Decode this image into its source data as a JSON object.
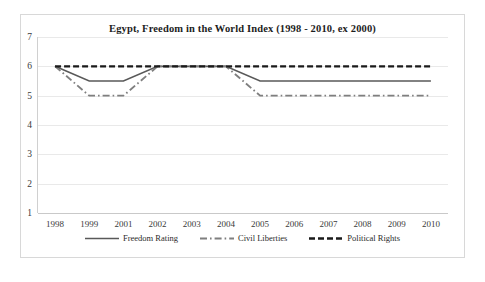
{
  "chart_data": {
    "type": "line",
    "title": "Egypt, Freedom in the World Index (1998 - 2010, ex 2000)",
    "xlabel": "",
    "ylabel": "",
    "categories": [
      "1998",
      "1999",
      "2001",
      "2002",
      "2003",
      "2004",
      "2005",
      "2006",
      "2007",
      "2008",
      "2009",
      "2010"
    ],
    "ylim": [
      1,
      7
    ],
    "yticks": [
      "1",
      "2",
      "3",
      "4",
      "5",
      "6",
      "7"
    ],
    "grid": true,
    "legend_position": "bottom",
    "series": [
      {
        "name": "Freedom Rating",
        "style": "solid",
        "color": "#595959",
        "values": [
          6,
          5.5,
          5.5,
          6,
          6,
          6,
          5.5,
          5.5,
          5.5,
          5.5,
          5.5,
          5.5
        ]
      },
      {
        "name": "Civil Liberties",
        "style": "dash-dot",
        "color": "#7f7f7f",
        "values": [
          6,
          5,
          5,
          6,
          6,
          6,
          5,
          5,
          5,
          5,
          5,
          5
        ]
      },
      {
        "name": "Political Rights",
        "style": "dashed",
        "color": "#1a1a1a",
        "values": [
          6,
          6,
          6,
          6,
          6,
          6,
          6,
          6,
          6,
          6,
          6,
          6
        ]
      }
    ]
  },
  "legend": {
    "items": [
      {
        "label": "Freedom Rating"
      },
      {
        "label": "Civil Liberties"
      },
      {
        "label": "Political Rights"
      }
    ]
  }
}
